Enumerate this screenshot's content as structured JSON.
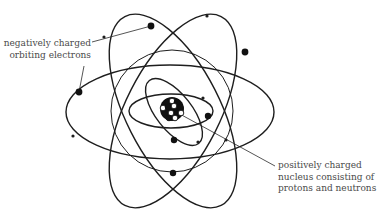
{
  "diagram": {
    "labels": {
      "electrons": {
        "lines": [
          "negatively charged",
          "orbiting electrons"
        ]
      },
      "nucleus": {
        "lines": [
          "positively charged",
          "nucleus consisting of",
          "protons and neutrons"
        ]
      }
    },
    "colors": {
      "stroke": "#1e1e1e",
      "text": "#4a4a4a",
      "background": "#ffffff",
      "proton": "#111111",
      "neutron": "#ffffff"
    },
    "nucleus": {
      "cx": 172,
      "cy": 109,
      "r": 12
    },
    "orbits": [
      {
        "name": "outer-horizontal",
        "cx": 170,
        "cy": 112,
        "rx": 104,
        "ry": 47,
        "rotate": 0
      },
      {
        "name": "outer-tilted-left",
        "cx": 173,
        "cy": 111,
        "rx": 47,
        "ry": 106,
        "rotate": -27
      },
      {
        "name": "outer-tilted-right",
        "cx": 173,
        "cy": 111,
        "rx": 47,
        "ry": 106,
        "rotate": 27
      },
      {
        "name": "middle-circle",
        "cx": 172,
        "cy": 111,
        "rx": 61,
        "ry": 61,
        "rotate": 0
      },
      {
        "name": "inner-horizontal",
        "cx": 171,
        "cy": 111,
        "rx": 42,
        "ry": 17,
        "rotate": 0
      },
      {
        "name": "inner-tilted",
        "cx": 174,
        "cy": 112,
        "rx": 18,
        "ry": 40,
        "rotate": -38
      }
    ],
    "electrons": [
      {
        "cx": 151,
        "cy": 26,
        "r": 3.4
      },
      {
        "cx": 245,
        "cy": 52,
        "r": 3.4
      },
      {
        "cx": 79,
        "cy": 92,
        "r": 3.4
      },
      {
        "cx": 208,
        "cy": 116,
        "r": 3.2
      },
      {
        "cx": 174,
        "cy": 140,
        "r": 3.2
      },
      {
        "cx": 173,
        "cy": 173,
        "r": 3.2
      }
    ],
    "orbit_markers": [
      {
        "cx": 104,
        "cy": 37,
        "r": 1.6
      },
      {
        "cx": 207,
        "cy": 16,
        "r": 1.6
      },
      {
        "cx": 73,
        "cy": 136,
        "r": 1.6
      },
      {
        "cx": 226,
        "cy": 140,
        "r": 1.6
      },
      {
        "cx": 203,
        "cy": 98,
        "r": 1.6
      },
      {
        "cx": 198,
        "cy": 142,
        "r": 1.6
      }
    ]
  }
}
